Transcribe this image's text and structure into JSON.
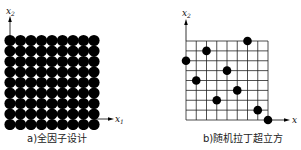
{
  "figure_a": {
    "caption": "a)全因子设计",
    "x_axis_label": "x",
    "x_axis_sub": "1",
    "y_axis_label": "x",
    "y_axis_sub": "2",
    "grid_levels": 9,
    "points": "all 81 grid points (9x9 full factorial)"
  },
  "figure_b": {
    "caption": "b)随机拉丁超立方",
    "x_axis_label": "x",
    "x_axis_sub": "1",
    "y_axis_label": "x",
    "y_axis_sub": "2",
    "grid_levels": 9,
    "points": [
      {
        "col": 0,
        "row": 2
      },
      {
        "col": 1,
        "row": 4
      },
      {
        "col": 2,
        "row": 1
      },
      {
        "col": 3,
        "row": 6
      },
      {
        "col": 4,
        "row": 3
      },
      {
        "col": 5,
        "row": 5
      },
      {
        "col": 6,
        "row": 0
      },
      {
        "col": 7,
        "row": 7
      },
      {
        "col": 8,
        "row": 8
      }
    ]
  },
  "colors": {
    "ink": "#000000",
    "background": "#ffffff",
    "grid": "#222222"
  }
}
